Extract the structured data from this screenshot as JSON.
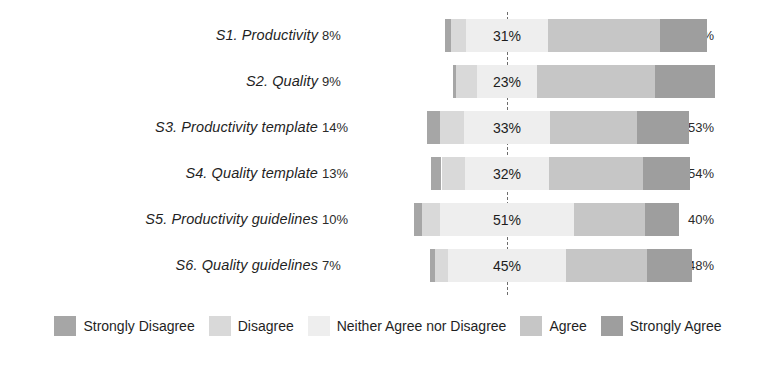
{
  "chart_data": {
    "type": "bar",
    "subtype": "diverging-stacked-likert",
    "title": "",
    "xlabel": "",
    "ylabel": "",
    "grid": false,
    "legend_position": "bottom",
    "categories": [
      "S1. Productivity",
      "S2. Quality",
      "S3. Productivity template",
      "S4. Quality template",
      "S5. Productivity guidelines",
      "S6. Quality guidelines"
    ],
    "series": [
      {
        "name": "Strongly Disagree",
        "color": "#a6a6a6",
        "values": [
          2,
          1,
          5,
          4,
          3,
          2
        ]
      },
      {
        "name": "Disagree",
        "color": "#d9d9d9",
        "values": [
          6,
          8,
          9,
          9,
          7,
          5
        ]
      },
      {
        "name": "Neither Agree nor Disagree",
        "color": "#eeeeee",
        "values": [
          31,
          23,
          33,
          32,
          51,
          45
        ]
      },
      {
        "name": "Agree",
        "color": "#c6c6c6",
        "values": [
          43,
          45,
          33,
          36,
          27,
          31
        ]
      },
      {
        "name": "Strongly Agree",
        "color": "#9e9e9e",
        "values": [
          18,
          23,
          20,
          18,
          13,
          17
        ]
      }
    ],
    "left_totals_labels": [
      "8%",
      "9%",
      "14%",
      "13%",
      "10%",
      "7%"
    ],
    "center_labels": [
      "31%",
      "23%",
      "33%",
      "32%",
      "51%",
      "45%"
    ],
    "right_totals_labels": [
      "61%",
      "68%",
      "53%",
      "54%",
      "40%",
      "48%"
    ],
    "left_totals": [
      8,
      9,
      14,
      13,
      10,
      7
    ],
    "center_values": [
      31,
      23,
      33,
      32,
      51,
      45
    ],
    "right_totals": [
      61,
      68,
      53,
      54,
      40,
      48
    ]
  },
  "rows": [
    {
      "label": "S1. Productivity",
      "left_pct": "8%",
      "center_pct": "31%",
      "right_pct": "61%",
      "segments": [
        {
          "name": "Strongly Disagree",
          "value": 2
        },
        {
          "name": "Disagree",
          "value": 6
        },
        {
          "name": "Neither Agree nor Disagree",
          "value": 31
        },
        {
          "name": "Agree",
          "value": 43
        },
        {
          "name": "Strongly Agree",
          "value": 18
        }
      ]
    },
    {
      "label": "S2. Quality",
      "left_pct": "9%",
      "center_pct": "23%",
      "right_pct": "68%",
      "segments": [
        {
          "name": "Strongly Disagree",
          "value": 1
        },
        {
          "name": "Disagree",
          "value": 8
        },
        {
          "name": "Neither Agree nor Disagree",
          "value": 23
        },
        {
          "name": "Agree",
          "value": 45
        },
        {
          "name": "Strongly Agree",
          "value": 23
        }
      ]
    },
    {
      "label": "S3. Productivity template",
      "left_pct": "14%",
      "center_pct": "33%",
      "right_pct": "53%",
      "segments": [
        {
          "name": "Strongly Disagree",
          "value": 5
        },
        {
          "name": "Disagree",
          "value": 9
        },
        {
          "name": "Neither Agree nor Disagree",
          "value": 33
        },
        {
          "name": "Agree",
          "value": 33
        },
        {
          "name": "Strongly Agree",
          "value": 20
        }
      ]
    },
    {
      "label": "S4. Quality template",
      "left_pct": "13%",
      "center_pct": "32%",
      "right_pct": "54%",
      "segments": [
        {
          "name": "Strongly Disagree",
          "value": 4
        },
        {
          "name": "Disagree",
          "value": 9
        },
        {
          "name": "Neither Agree nor Disagree",
          "value": 32
        },
        {
          "name": "Agree",
          "value": 36
        },
        {
          "name": "Strongly Agree",
          "value": 18
        }
      ]
    },
    {
      "label": "S5. Productivity guidelines",
      "left_pct": "10%",
      "center_pct": "51%",
      "right_pct": "40%",
      "segments": [
        {
          "name": "Strongly Disagree",
          "value": 3
        },
        {
          "name": "Disagree",
          "value": 7
        },
        {
          "name": "Neither Agree nor Disagree",
          "value": 51
        },
        {
          "name": "Agree",
          "value": 27
        },
        {
          "name": "Strongly Agree",
          "value": 13
        }
      ]
    },
    {
      "label": "S6. Quality guidelines",
      "left_pct": "7%",
      "center_pct": "45%",
      "right_pct": "48%",
      "segments": [
        {
          "name": "Strongly Disagree",
          "value": 2
        },
        {
          "name": "Disagree",
          "value": 5
        },
        {
          "name": "Neither Agree nor Disagree",
          "value": 45
        },
        {
          "name": "Agree",
          "value": 31
        },
        {
          "name": "Strongly Agree",
          "value": 17
        }
      ]
    }
  ],
  "legend": {
    "items": [
      {
        "label": "Strongly Disagree",
        "color": "#a6a6a6"
      },
      {
        "label": "Disagree",
        "color": "#d9d9d9"
      },
      {
        "label": "Neither Agree nor Disagree",
        "color": "#eeeeee"
      },
      {
        "label": "Agree",
        "color": "#c6c6c6"
      },
      {
        "label": "Strongly Agree",
        "color": "#9e9e9e"
      }
    ]
  },
  "layout": {
    "zero_line_x": 507,
    "px_per_pct": 2.62,
    "row_tops": [
      12,
      58,
      104,
      150,
      196,
      242
    ]
  }
}
